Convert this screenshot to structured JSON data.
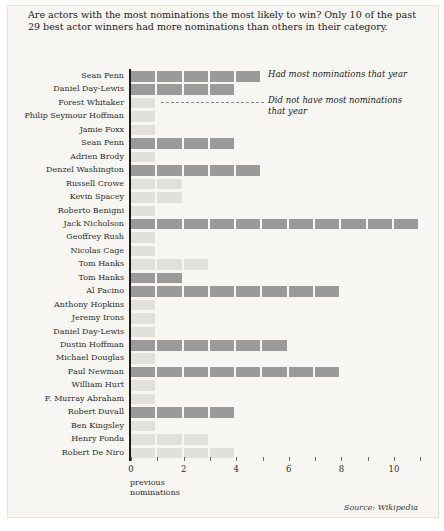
{
  "title": "Are actors with the most nominations the most likely to win? Only 10 of the past 29 best actor winners had more nominations than others in their category.",
  "legend": {
    "had_most_label": "Had most nominations that year",
    "not_most_label": "Did not have most nominations that year"
  },
  "axis": {
    "xlabel_line1": "previous",
    "xlabel_line2": "nominations",
    "tick_labels_shown": [
      "0",
      "2",
      "4",
      "6",
      "8",
      "10"
    ]
  },
  "source": "Source: Wikipedia",
  "colors": {
    "had_most_bar": "#9a9a9a",
    "not_most_bar": "#e2e0db",
    "background": "#f7f6f2"
  },
  "chart_data": {
    "type": "bar",
    "orientation": "horizontal",
    "title": "Are actors with the most nominations the most likely to win? Only 10 of the past 29 best actor winners had more nominations than others in their category.",
    "xlabel": "previous nominations",
    "xlim": [
      0,
      11
    ],
    "x_ticks": [
      0,
      1,
      2,
      3,
      4,
      5,
      6,
      7,
      8,
      9,
      10,
      11
    ],
    "x_tick_labels": [
      0,
      2,
      4,
      6,
      8,
      10
    ],
    "legend_entries": [
      "Had most nominations that year",
      "Did not have most nominations that year"
    ],
    "rows": [
      {
        "actor": "Sean Penn",
        "nominations": 5,
        "had_most": true
      },
      {
        "actor": "Daniel Day-Lewis",
        "nominations": 4,
        "had_most": true
      },
      {
        "actor": "Forest Whitaker",
        "nominations": 1,
        "had_most": false
      },
      {
        "actor": "Philip Seymour Hoffman",
        "nominations": 1,
        "had_most": false
      },
      {
        "actor": "Jamie Foxx",
        "nominations": 1,
        "had_most": false
      },
      {
        "actor": "Sean Penn",
        "nominations": 4,
        "had_most": true
      },
      {
        "actor": "Adrien Brody",
        "nominations": 1,
        "had_most": false
      },
      {
        "actor": "Denzel Washington",
        "nominations": 5,
        "had_most": true
      },
      {
        "actor": "Russell Crowe",
        "nominations": 2,
        "had_most": false
      },
      {
        "actor": "Kevin Spacey",
        "nominations": 2,
        "had_most": false
      },
      {
        "actor": "Roberto Benigni",
        "nominations": 1,
        "had_most": false
      },
      {
        "actor": "Jack Nicholson",
        "nominations": 11,
        "had_most": true
      },
      {
        "actor": "Geoffrey Rush",
        "nominations": 1,
        "had_most": false
      },
      {
        "actor": "Nicolas Cage",
        "nominations": 1,
        "had_most": false
      },
      {
        "actor": "Tom Hanks",
        "nominations": 3,
        "had_most": false
      },
      {
        "actor": "Tom Hanks",
        "nominations": 2,
        "had_most": true
      },
      {
        "actor": "Al Pacino",
        "nominations": 8,
        "had_most": true
      },
      {
        "actor": "Anthony Hopkins",
        "nominations": 1,
        "had_most": false
      },
      {
        "actor": "Jeremy Irons",
        "nominations": 1,
        "had_most": false
      },
      {
        "actor": "Daniel Day-Lewis",
        "nominations": 1,
        "had_most": false
      },
      {
        "actor": "Dustin Hoffman",
        "nominations": 6,
        "had_most": true
      },
      {
        "actor": "Michael Douglas",
        "nominations": 1,
        "had_most": false
      },
      {
        "actor": "Paul Newman",
        "nominations": 8,
        "had_most": true
      },
      {
        "actor": "William Hurt",
        "nominations": 1,
        "had_most": false
      },
      {
        "actor": "F. Murray Abraham",
        "nominations": 1,
        "had_most": false
      },
      {
        "actor": "Robert Duvall",
        "nominations": 4,
        "had_most": true
      },
      {
        "actor": "Ben Kingsley",
        "nominations": 1,
        "had_most": false
      },
      {
        "actor": "Henry Fonda",
        "nominations": 3,
        "had_most": false
      },
      {
        "actor": "Robert De Niro",
        "nominations": 4,
        "had_most": false
      }
    ]
  }
}
